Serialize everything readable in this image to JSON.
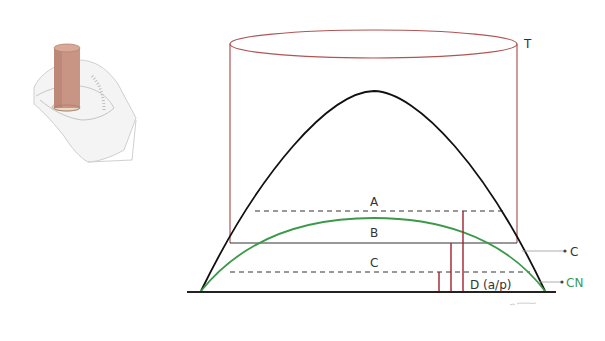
{
  "labels": {
    "tank": "T",
    "zone_a": "A",
    "zone_b": "B",
    "zone_c": "C",
    "zone_d": "D (a/p)",
    "capacity": "C",
    "critical": "CN"
  },
  "colors": {
    "tank": "#b05555",
    "black_curve": "#111111",
    "green_curve": "#3a9a4a",
    "red_lines": "#a02030",
    "ground": "#222222",
    "label": "#333333",
    "label_green": "#3a9a5a"
  }
}
